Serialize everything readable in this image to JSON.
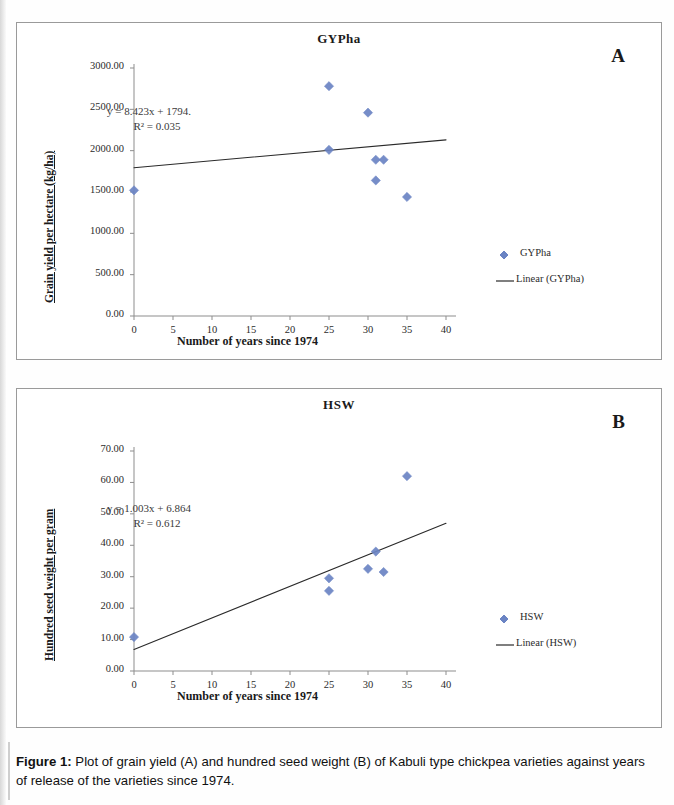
{
  "figure": {
    "caption_label": "Figure 1:",
    "caption_text": " Plot of grain yield (A) and hundred seed weight (B) of Kabuli type chickpea varieties against years of release of the varieties since 1974."
  },
  "colors": {
    "marker": "#6b84c4",
    "trendline": "#2a2a2a",
    "axis": "#8d8d8d",
    "text": "#1a1a1a"
  },
  "panel_a": {
    "letter": "A",
    "legend": {
      "series_label": "GYPha",
      "trend_label": "Linear (GYPha)",
      "marker_icon": "diamond-marker-icon",
      "line_icon": "trendline-icon"
    },
    "chart_data": {
      "type": "scatter",
      "title": "GYPha",
      "xlabel": "Number of years since 1974",
      "ylabel": "Grain yield per hectare (kg/ha)",
      "xlim": [
        0,
        40
      ],
      "ylim": [
        0,
        3000
      ],
      "xticks": [
        0,
        5,
        10,
        15,
        20,
        25,
        30,
        35,
        40
      ],
      "xtick_labels": [
        "0",
        "5",
        "10",
        "15",
        "20",
        "25",
        "30",
        "35",
        "40"
      ],
      "yticks": [
        0,
        500,
        1000,
        1500,
        2000,
        2500,
        3000
      ],
      "ytick_labels": [
        "0.00",
        "500.00",
        "1000.00",
        "1500.00",
        "2000.00",
        "2500.00",
        "3000.00"
      ],
      "grid": false,
      "legend_position": "right",
      "series": [
        {
          "name": "GYPha",
          "marker": "diamond",
          "points": [
            {
              "x": 0,
              "y": 1520
            },
            {
              "x": 25,
              "y": 2780
            },
            {
              "x": 25,
              "y": 2010
            },
            {
              "x": 30,
              "y": 2460
            },
            {
              "x": 31,
              "y": 1890
            },
            {
              "x": 32,
              "y": 1890
            },
            {
              "x": 31,
              "y": 1640
            },
            {
              "x": 35,
              "y": 1440
            }
          ]
        }
      ],
      "trendline": {
        "name": "Linear (GYPha)",
        "slope": 8.423,
        "intercept": 1794,
        "equation": "y = 8.423x + 1794.",
        "r2_text": "R² = 0.035",
        "r2": 0.035
      },
      "annotations": [
        "y = 8.423x + 1794.",
        "R² = 0.035"
      ]
    }
  },
  "panel_b": {
    "letter": "B",
    "legend": {
      "series_label": "HSW",
      "trend_label": "Linear (HSW)",
      "marker_icon": "diamond-marker-icon",
      "line_icon": "trendline-icon"
    },
    "chart_data": {
      "type": "scatter",
      "title": "HSW",
      "xlabel": "Number of years since 1974",
      "ylabel": "Hundred seed weight per gram",
      "xlim": [
        0,
        40
      ],
      "ylim": [
        0,
        70
      ],
      "xticks": [
        0,
        5,
        10,
        15,
        20,
        25,
        30,
        35,
        40
      ],
      "xtick_labels": [
        "0",
        "5",
        "10",
        "15",
        "20",
        "25",
        "30",
        "35",
        "40"
      ],
      "yticks": [
        0,
        10,
        20,
        30,
        40,
        50,
        60,
        70
      ],
      "ytick_labels": [
        "0.00",
        "10.00",
        "20.00",
        "30.00",
        "40.00",
        "50.00",
        "60.00",
        "70.00"
      ],
      "grid": false,
      "legend_position": "right",
      "series": [
        {
          "name": "HSW",
          "marker": "diamond",
          "points": [
            {
              "x": 0,
              "y": 10.8
            },
            {
              "x": 25,
              "y": 29.5
            },
            {
              "x": 25,
              "y": 25.5
            },
            {
              "x": 30,
              "y": 32.5
            },
            {
              "x": 31,
              "y": 38.0
            },
            {
              "x": 32,
              "y": 31.5
            },
            {
              "x": 35,
              "y": 62.0
            }
          ]
        }
      ],
      "trendline": {
        "name": "Linear (HSW)",
        "slope": 1.003,
        "intercept": 6.864,
        "equation": "y = 1.003x + 6.864",
        "r2_text": "R² = 0.612",
        "r2": 0.612
      },
      "annotations": [
        "y = 1.003x + 6.864",
        "R² = 0.612"
      ]
    }
  }
}
